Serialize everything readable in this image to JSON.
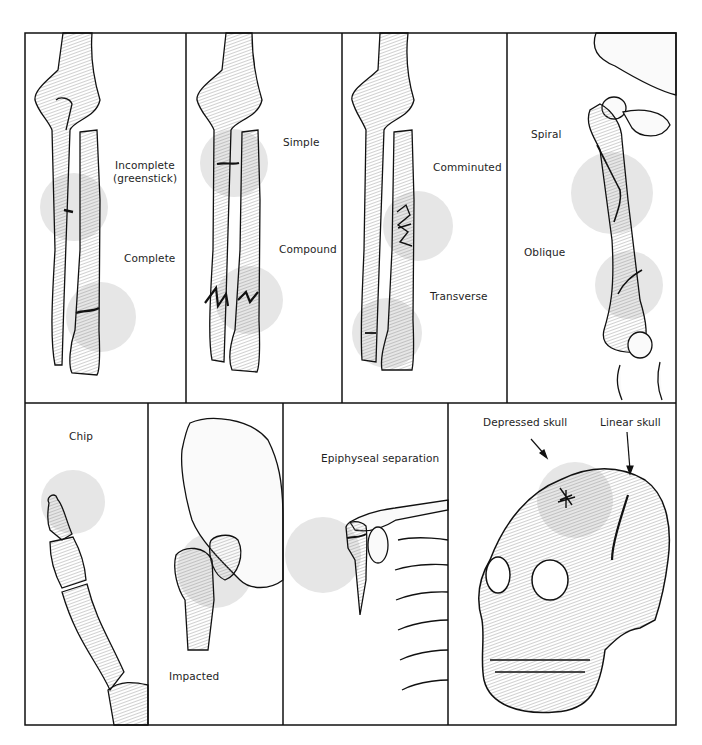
{
  "figure": {
    "panels": [
      {
        "id": "forearm-incomplete-complete",
        "labels": [
          "Incomplete\n(greenstick)",
          "Complete"
        ]
      },
      {
        "id": "forearm-simple-compound",
        "labels": [
          "Simple",
          "Compound"
        ]
      },
      {
        "id": "forearm-comminuted-transverse",
        "labels": [
          "Comminuted",
          "Transverse"
        ]
      },
      {
        "id": "femur-spiral-oblique",
        "labels": [
          "Spiral",
          "Oblique"
        ]
      },
      {
        "id": "finger-chip",
        "labels": [
          "Chip"
        ]
      },
      {
        "id": "hip-impacted",
        "labels": [
          "Impacted"
        ]
      },
      {
        "id": "shoulder-epiphyseal",
        "labels": [
          "Epiphyseal separation"
        ]
      },
      {
        "id": "skull",
        "labels": [
          "Depressed skull",
          "Linear skull"
        ]
      }
    ],
    "labels": {
      "incomplete": "Incomplete",
      "greenstick": "(greenstick)",
      "complete": "Complete",
      "simple": "Simple",
      "compound": "Compound",
      "comminuted": "Comminuted",
      "transverse": "Transverse",
      "spiral": "Spiral",
      "oblique": "Oblique",
      "chip": "Chip",
      "impacted": "Impacted",
      "epiphyseal": "Epiphyseal separation",
      "depressed_skull": "Depressed skull",
      "linear_skull": "Linear skull"
    },
    "colors": {
      "line": "#111111",
      "highlight": "#e6e6e6",
      "bone_shade": "#cfcfcf",
      "background": "#ffffff"
    }
  }
}
